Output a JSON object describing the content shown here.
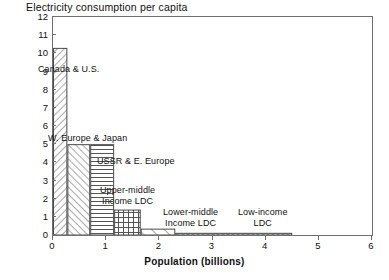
{
  "chart_data": {
    "type": "bar",
    "title": "Electricity consumption per capita",
    "xlabel": "Population (billions)",
    "ylabel": "",
    "xlim": [
      0,
      6
    ],
    "ylim": [
      0,
      12
    ],
    "xticks": [
      0,
      1,
      2,
      3,
      4,
      5,
      6
    ],
    "yticks": [
      0,
      1,
      2,
      3,
      4,
      5,
      6,
      7,
      8,
      9,
      10,
      11,
      12
    ],
    "grid": false,
    "legend": "inline-annotations",
    "note": "Variable-width bars: width = population (billions), height = electricity consumption per capita",
    "bars": [
      {
        "label": "Canada & U.S.",
        "x_start": 0.0,
        "x_end": 0.27,
        "width": 0.27,
        "value": 10.3,
        "pattern": "diagonal-hatch-right"
      },
      {
        "label": "W. Europe & Japan",
        "x_start": 0.27,
        "x_end": 0.7,
        "width": 0.43,
        "value": 5.0,
        "pattern": "diagonal-hatch-left"
      },
      {
        "label": "USSR & E. Europe",
        "x_start": 0.7,
        "x_end": 1.15,
        "width": 0.45,
        "value": 5.0,
        "pattern": "horizontal-lines"
      },
      {
        "label": "Upper-middle\nIncome LDC",
        "x_start": 1.15,
        "x_end": 1.65,
        "width": 0.5,
        "value": 1.4,
        "pattern": "crosshatch-grid"
      },
      {
        "label": "Lower-middle\nIncome LDC",
        "x_start": 1.65,
        "x_end": 2.3,
        "width": 0.65,
        "value": 0.35,
        "pattern": "diagonal-hatch-wide"
      },
      {
        "label": "Low-income\nLDC",
        "x_start": 2.3,
        "x_end": 4.5,
        "width": 2.2,
        "value": 0.12,
        "pattern": "beads-circles"
      }
    ],
    "annotations": [
      {
        "text": "Canada & U.S.",
        "x_px": 38,
        "y_px": 64,
        "align": "left"
      },
      {
        "text": "W. Europe & Japan",
        "x_px": 48,
        "y_px": 133,
        "align": "left"
      },
      {
        "text": "USSR & E. Europe",
        "x_px": 97,
        "y_px": 156,
        "align": "left"
      },
      {
        "text": "Upper-middle\nIncome LDC",
        "x_px": 100,
        "y_px": 185,
        "align": "center"
      },
      {
        "text": "Lower-middle\nIncome LDC",
        "x_px": 163,
        "y_px": 207,
        "align": "center"
      },
      {
        "text": "Low-income\nLDC",
        "x_px": 238,
        "y_px": 207,
        "align": "center"
      }
    ],
    "colors": {
      "axis": "#6f6f6f",
      "bar_edge": "#4a4a4a",
      "bar_fill": "#ffffff",
      "pattern": "#555555",
      "text": "#111111",
      "background": "#ffffff"
    }
  }
}
